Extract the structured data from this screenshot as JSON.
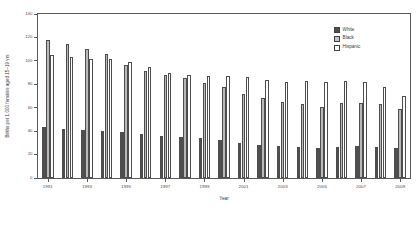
{
  "chart_data": {
    "type": "bar",
    "title": "",
    "xlabel": "Year",
    "ylabel": "Births per 1,000 females aged 15–19 yrs",
    "ylim": [
      0,
      140
    ],
    "yticks": [
      0,
      20,
      40,
      60,
      80,
      100,
      120,
      140
    ],
    "grid": false,
    "legend_position": "top-right",
    "categories": [
      "1991",
      "1992",
      "1993",
      "1994",
      "1995",
      "1996",
      "1997",
      "1998",
      "1999",
      "2000",
      "2001",
      "2002",
      "2003",
      "2004",
      "2005",
      "2006",
      "2007",
      "2008",
      "2009"
    ],
    "xtick_labels_shown": [
      "1991",
      "1993",
      "1995",
      "1997",
      "1999",
      "2001",
      "2003",
      "2005",
      "2007",
      "2009"
    ],
    "series": [
      {
        "name": "White",
        "color": "#4f4f4f",
        "values": [
          43.4,
          41.7,
          40.7,
          40.4,
          39.3,
          37.6,
          36.0,
          35.3,
          34.1,
          32.6,
          30.3,
          28.5,
          27.4,
          26.7,
          25.9,
          26.6,
          27.2,
          26.7,
          25.6
        ]
      },
      {
        "name": "Black",
        "color": "#b9b9b9",
        "values": [
          118.2,
          114.7,
          110.5,
          105.7,
          96.1,
          91.4,
          88.2,
          85.4,
          81.0,
          77.4,
          71.8,
          68.3,
          64.8,
          62.9,
          60.9,
          63.7,
          64.3,
          62.9,
          59.0
        ]
      },
      {
        "name": "Hispanic",
        "color": "#ffffff",
        "values": [
          104.6,
          103.3,
          101.8,
          101.3,
          99.3,
          94.6,
          89.6,
          87.9,
          86.8,
          87.3,
          86.4,
          83.4,
          82.3,
          82.6,
          81.7,
          83.0,
          81.7,
          77.4,
          70.1
        ]
      }
    ]
  },
  "legend": {
    "items": [
      {
        "label": "White",
        "swatch": "white-s"
      },
      {
        "label": "Black",
        "swatch": "black-s"
      },
      {
        "label": "Hispanic",
        "swatch": "hisp-s"
      }
    ]
  },
  "axes": {
    "y_title": "Births per 1,000 females aged 15–19 yrs",
    "x_title": "Year"
  }
}
